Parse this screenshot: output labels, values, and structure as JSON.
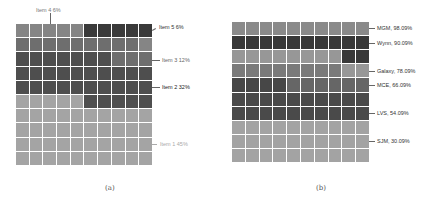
{
  "figure": {
    "captions": [
      "(a)",
      "(b)"
    ]
  },
  "colors": {
    "a": {
      "item1": "#a4a4a4",
      "item2": "#4e4e4e",
      "item3": "#6e6e6e",
      "item4": "#858585",
      "item5": "#3a3a3a"
    },
    "b": {
      "mgm": "#8a8a8a",
      "wynn": "#383838",
      "galaxy_row": "#979797",
      "galaxy": "#7a7a7a",
      "mce_dark": "#474747",
      "mce": "#666666",
      "lvs": "#4a4a4a",
      "sjm": "#a3a3a3"
    }
  },
  "chart_data": [
    {
      "type": "waffle",
      "panel": "(a)",
      "grid": [
        10,
        10
      ],
      "categories": [
        "Item 1",
        "Item 2",
        "Item 3",
        "Item 4",
        "Item 5"
      ],
      "values": [
        45,
        32,
        12,
        6,
        6
      ],
      "unit": "%",
      "labels": [
        "Item 1  45%",
        "Item 2  32%",
        "Item 3  12%",
        "Item 4  6%",
        "Item 5  6%"
      ],
      "legend_position": "right (leader lines), Item 4 above",
      "cells": [
        [
          "item4",
          "item4",
          "item4",
          "item4",
          "item4",
          "item5",
          "item5",
          "item5",
          "item5",
          "item5"
        ],
        [
          "item3",
          "item3",
          "item3",
          "item3",
          "item3",
          "item3",
          "item3",
          "item3",
          "item3",
          "item4"
        ],
        [
          "item2",
          "item2",
          "item2",
          "item2",
          "item2",
          "item2",
          "item2",
          "item3",
          "item3",
          "item3"
        ],
        [
          "item2",
          "item2",
          "item2",
          "item2",
          "item2",
          "item2",
          "item2",
          "item2",
          "item2",
          "item2"
        ],
        [
          "item2",
          "item2",
          "item2",
          "item2",
          "item2",
          "item2",
          "item2",
          "item2",
          "item2",
          "item2"
        ],
        [
          "item1",
          "item1",
          "item1",
          "item1",
          "item1",
          "item2",
          "item2",
          "item2",
          "item2",
          "item2"
        ],
        [
          "item1",
          "item1",
          "item1",
          "item1",
          "item1",
          "item1",
          "item1",
          "item1",
          "item1",
          "item1"
        ],
        [
          "item1",
          "item1",
          "item1",
          "item1",
          "item1",
          "item1",
          "item1",
          "item1",
          "item1",
          "item1"
        ],
        [
          "item1",
          "item1",
          "item1",
          "item1",
          "item1",
          "item1",
          "item1",
          "item1",
          "item1",
          "item1"
        ],
        [
          "item1",
          "item1",
          "item1",
          "item1",
          "item1",
          "item1",
          "item1",
          "item1",
          "item1",
          "item1"
        ]
      ]
    },
    {
      "type": "waffle",
      "panel": "(b)",
      "grid": [
        10,
        10
      ],
      "categories": [
        "MGM",
        "Wynn",
        "Galaxy",
        "MCE",
        "LVS",
        "SJM"
      ],
      "values": [
        98.09,
        90.09,
        78.09,
        66.09,
        54.09,
        30.09
      ],
      "unit": "%",
      "labels": [
        "MGM, 98.09%",
        "Wynn, 90.09%",
        "Galaxy, 78.09%",
        "MCE, 66.09%",
        "LVS, 54.09%",
        "SJM, 30.09%"
      ],
      "legend_position": "right (leader lines)",
      "cells": [
        [
          "mgm",
          "mgm",
          "mgm",
          "mgm",
          "mgm",
          "mgm",
          "mgm",
          "mgm",
          "mgm",
          "mgm"
        ],
        [
          "wynn",
          "wynn",
          "wynn",
          "wynn",
          "wynn",
          "wynn",
          "wynn",
          "wynn",
          "wynn",
          "wynn"
        ],
        [
          "galaxy_row",
          "galaxy_row",
          "galaxy_row",
          "galaxy_row",
          "galaxy_row",
          "galaxy_row",
          "galaxy_row",
          "galaxy_row",
          "wynn",
          "wynn"
        ],
        [
          "galaxy",
          "galaxy",
          "galaxy",
          "galaxy",
          "galaxy",
          "galaxy",
          "galaxy",
          "galaxy",
          "galaxy_row",
          "galaxy_row"
        ],
        [
          "mce_dark",
          "mce_dark",
          "mce_dark",
          "mce_dark",
          "mce",
          "mce",
          "mce",
          "mce",
          "mce",
          "mce"
        ],
        [
          "lvs",
          "lvs",
          "lvs",
          "lvs",
          "lvs",
          "lvs",
          "lvs",
          "lvs",
          "lvs",
          "lvs"
        ],
        [
          "lvs",
          "lvs",
          "lvs",
          "lvs",
          "lvs",
          "lvs",
          "lvs",
          "lvs",
          "lvs",
          "lvs"
        ],
        [
          "sjm",
          "sjm",
          "sjm",
          "sjm",
          "sjm",
          "sjm",
          "sjm",
          "sjm",
          "sjm",
          "sjm"
        ],
        [
          "sjm",
          "sjm",
          "sjm",
          "sjm",
          "sjm",
          "sjm",
          "sjm",
          "sjm",
          "sjm",
          "sjm"
        ],
        [
          "sjm",
          "sjm",
          "sjm",
          "sjm",
          "sjm",
          "sjm",
          "sjm",
          "sjm",
          "sjm",
          "sjm"
        ]
      ]
    }
  ],
  "annotations": {
    "a": {
      "item4": "Item 4  6%",
      "item5": "Item 5  6%",
      "item3": "Item 3  12%",
      "item2": "Item 2  32%",
      "item1": "Item 1  45%"
    },
    "b": {
      "mgm": "MGM, 98.09%",
      "wynn": "Wynn, 90.09%",
      "galaxy": "Galaxy, 78.09%",
      "mce": "MCE, 66.09%",
      "lvs": "LVS, 54.09%",
      "sjm": "SJM, 30.09%"
    }
  }
}
